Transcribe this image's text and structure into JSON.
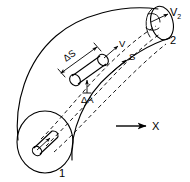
{
  "figure": {
    "background_color": "#ffffff",
    "line_color": "#000000"
  },
  "labels": {
    "inlet_station": "1",
    "outlet_station": "2",
    "outlet_velocity": "V",
    "outlet_velocity_subscript": "2",
    "element_length": "ΔS",
    "element_area": "ΔA",
    "velocity": "V",
    "streamline_coordinate": "S",
    "axis_x": "X"
  },
  "annotations": [
    {
      "name": "element-length",
      "text": "ΔS",
      "meaning": "differential length of fluid element along streamline"
    },
    {
      "name": "element-area",
      "text": "ΔA",
      "meaning": "differential cross-sectional area of fluid element"
    },
    {
      "name": "velocity-vector",
      "text": "V",
      "meaning": "local flow velocity along streamline"
    },
    {
      "name": "streamline-coordinate",
      "text": "S",
      "meaning": "distance coordinate measured along the streamline"
    },
    {
      "name": "outlet-velocity",
      "text": "V2",
      "meaning": "velocity at outlet station 2"
    },
    {
      "name": "inlet-station",
      "text": "1",
      "meaning": "inlet station label"
    },
    {
      "name": "outlet-station",
      "text": "2",
      "meaning": "outlet station label"
    },
    {
      "name": "x-axis",
      "text": "X",
      "meaning": "horizontal reference axis direction"
    }
  ]
}
